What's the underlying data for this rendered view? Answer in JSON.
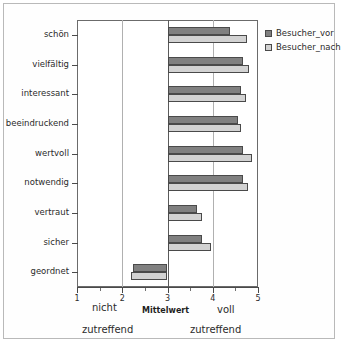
{
  "chart_data": {
    "type": "bar",
    "orientation": "horizontal",
    "title": "",
    "xlabel": "Mittelwert",
    "ylabel": "",
    "xlim": [
      1,
      5
    ],
    "baseline": 3,
    "grid": true,
    "gridlines": [
      2,
      4
    ],
    "xticks": [
      1,
      2,
      3,
      4,
      5
    ],
    "xtick_labels": [
      "1",
      "2",
      "3",
      "4",
      "5"
    ],
    "xticks_minor": [
      1.5,
      2.5,
      3.5,
      4.5
    ],
    "legend_position": "right-top",
    "categories": [
      "schön",
      "vielfältig",
      "interessant",
      "beeindruckend",
      "wertvoll",
      "notwendig",
      "vertraut",
      "sicher",
      "geordnet"
    ],
    "series": [
      {
        "name": "Besucher_vor",
        "color": "#808080",
        "values": [
          4.39,
          4.67,
          4.63,
          4.55,
          4.67,
          4.67,
          3.66,
          3.77,
          2.23
        ]
      },
      {
        "name": "Besucher_nach",
        "color": "#d2d2d2",
        "values": [
          4.76,
          4.8,
          4.74,
          4.63,
          4.87,
          4.78,
          3.76,
          3.97,
          2.2
        ]
      }
    ],
    "axis_captions": {
      "left_top": "nicht",
      "left_bottom": "zutreffend",
      "right_top": "voll",
      "right_bottom": "zutreffend",
      "center": "Mittelwert"
    }
  },
  "legend": {
    "items": [
      {
        "label": "Besucher_vor",
        "color": "#808080"
      },
      {
        "label": "Besucher_nach",
        "color": "#d2d2d2"
      }
    ]
  },
  "colors": {
    "bar_vor": "#808080",
    "bar_nach": "#d2d2d2",
    "bar_border": "#4a4a4a",
    "grid": "#b0b0b0",
    "axis": "#4a4a4a",
    "frame": "#b9b9b9",
    "background": "#ffffff"
  }
}
